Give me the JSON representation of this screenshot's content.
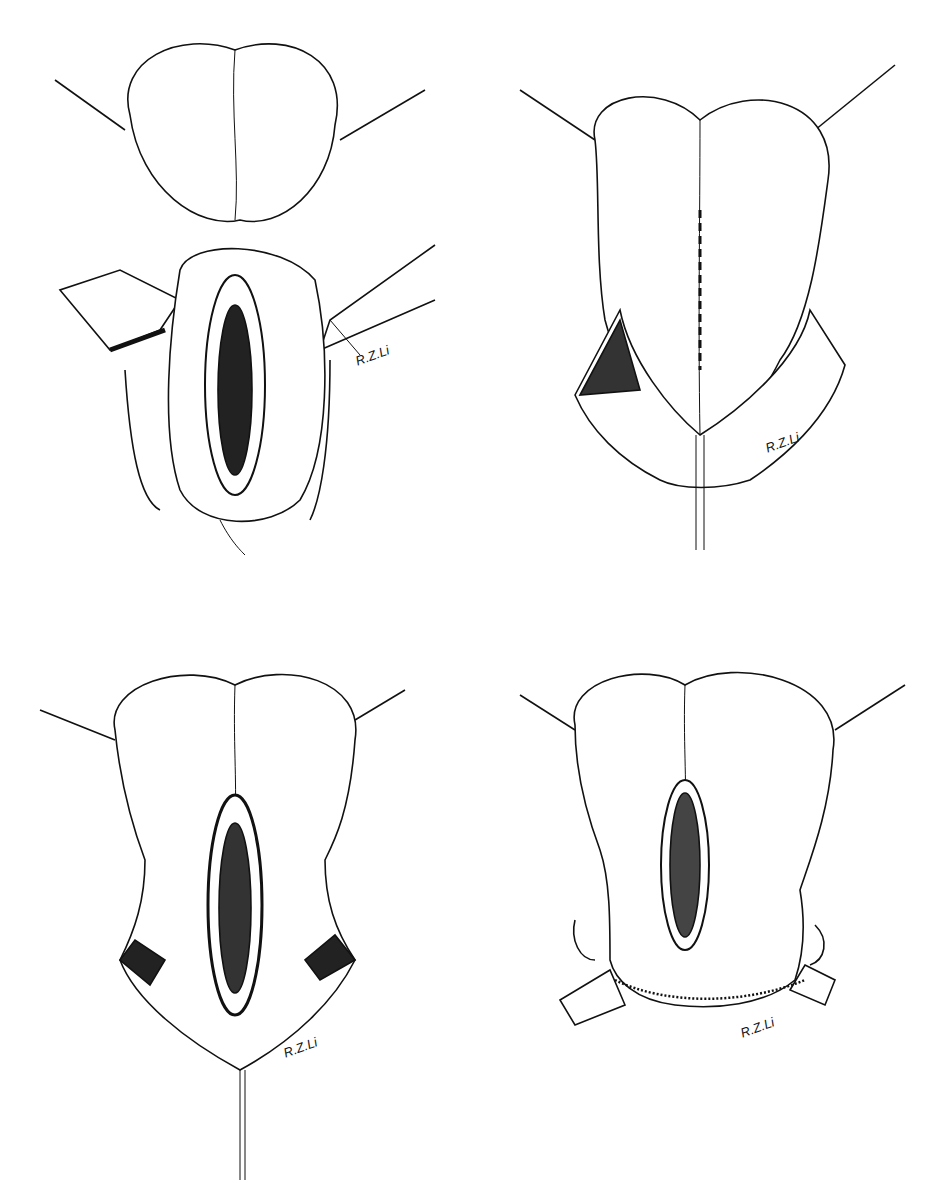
{
  "figure": {
    "panels": [
      {
        "id": "a",
        "position": "top-left",
        "signature": "R.Z.Li"
      },
      {
        "id": "b",
        "position": "top-right",
        "signature": "R.Z.Li"
      },
      {
        "id": "c",
        "position": "bottom-left",
        "signature": "R.Z.Li"
      },
      {
        "id": "d",
        "position": "bottom-right",
        "signature": "R.Z.Li"
      }
    ]
  }
}
